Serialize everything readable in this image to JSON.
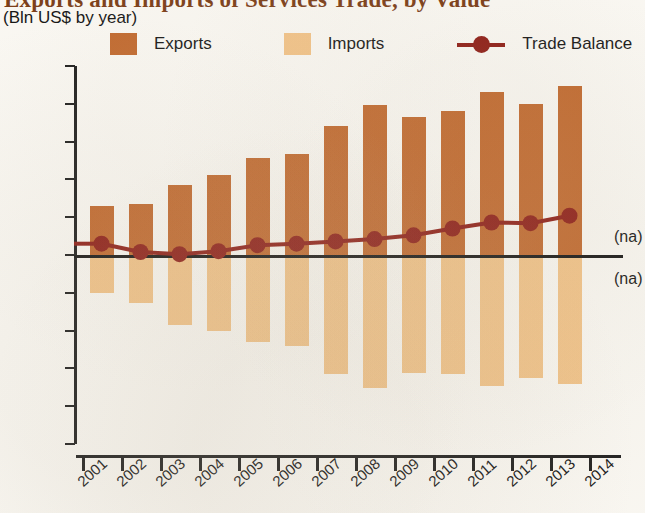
{
  "title": "Exports and Imports of Services Trade, by Value",
  "subtitle": "(Bln US$ by year)",
  "legend": {
    "exports_label": "Exports",
    "imports_label": "Imports",
    "balance_label": "Trade Balance"
  },
  "colors": {
    "exports": "#c1672b",
    "imports": "#f3c387",
    "trade_balance": "#8d1a13",
    "axis": "#1a1a1a",
    "background": "#fbf9f4",
    "title": "#7a3b14"
  },
  "annotations": {
    "na_above": "(na)",
    "na_below": "(na)"
  },
  "chart_data": {
    "type": "bar",
    "title": "Exports and Imports of Services Trade, by Value",
    "subtitle": "(Bln US$ by year)",
    "xlabel": "",
    "ylabel": "Bln US$",
    "ylim": [
      -25,
      25
    ],
    "yticks": [
      25,
      20,
      15,
      10,
      5,
      0,
      -5,
      -10,
      -15,
      -20,
      -25
    ],
    "ytick_labels": [
      "25",
      "20",
      "15",
      "10",
      "5",
      "0",
      "−5",
      "−10",
      "−15",
      "−20",
      "−25"
    ],
    "categories": [
      "2001",
      "2002",
      "2003",
      "2004",
      "2005",
      "2006",
      "2007",
      "2008",
      "2009",
      "2010",
      "2011",
      "2012",
      "2013"
    ],
    "xtick_labels": [
      "2001",
      "2002",
      "2003",
      "2004",
      "2005",
      "2006",
      "2007",
      "2008",
      "2009",
      "2010",
      "2011",
      "2012",
      "2013",
      "2014"
    ],
    "grid": false,
    "legend_position": "top",
    "series": [
      {
        "name": "Exports",
        "type": "bar",
        "color": "#c1672b",
        "values": [
          6.5,
          6.8,
          9.2,
          10.6,
          12.8,
          13.4,
          17.1,
          19.9,
          18.2,
          19.0,
          21.6,
          20.0,
          22.4
        ]
      },
      {
        "name": "Imports",
        "type": "bar",
        "color": "#f3c387",
        "values": [
          -5.0,
          -6.4,
          -9.2,
          -10.1,
          -11.5,
          -12.0,
          -15.7,
          -17.6,
          -15.6,
          -15.8,
          -17.3,
          -16.3,
          -17.1
        ]
      },
      {
        "name": "Trade Balance",
        "type": "line",
        "color": "#8d1a13",
        "values": [
          1.5,
          0.4,
          0.1,
          0.5,
          1.3,
          1.5,
          1.8,
          2.1,
          2.6,
          3.5,
          4.3,
          4.2,
          5.2
        ]
      }
    ]
  }
}
